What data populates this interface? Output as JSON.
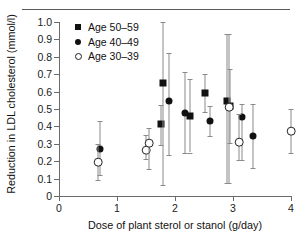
{
  "chart_data": {
    "type": "scatter",
    "title": "",
    "xlabel": "Dose of plant sterol or stanol (g/day)",
    "ylabel": "Reduction in LDL cholesterol (mmol/l)",
    "xlim": [
      0,
      4
    ],
    "ylim": [
      0,
      1.0
    ],
    "xticks": [
      "0",
      "1",
      "2",
      "3",
      "4"
    ],
    "yticks": [
      "0",
      "0.1",
      "0.2",
      "0.3",
      "0.4",
      "0.5",
      "0.6",
      "0.7",
      "0.8",
      "0.9",
      "1.0"
    ],
    "grid": false,
    "legend_position": "top-left",
    "error_bars": "vertical with caps",
    "series": [
      {
        "name": "Age 50–59",
        "marker": "filled-square",
        "color": "#111111",
        "points": [
          {
            "x": 1.75,
            "y": 0.415,
            "lo": 0.295,
            "hi": 0.525
          },
          {
            "x": 1.8,
            "y": 0.648,
            "lo": 0.062,
            "hi": 1.0
          },
          {
            "x": 2.26,
            "y": 0.458,
            "lo": 0.25,
            "hi": 0.672
          },
          {
            "x": 2.52,
            "y": 0.592,
            "lo": 0.482,
            "hi": 0.7
          },
          {
            "x": 2.9,
            "y": 0.545,
            "lo": 0.075,
            "hi": 0.93
          },
          {
            "x": 2.95,
            "y": 0.515,
            "lo": 0.305,
            "hi": 0.728
          }
        ]
      },
      {
        "name": "Age 40–49",
        "marker": "filled-circle",
        "color": "#111111",
        "points": [
          {
            "x": 0.7,
            "y": 0.268,
            "lo": 0.118,
            "hi": 0.432
          },
          {
            "x": 1.9,
            "y": 0.548,
            "lo": 0.235,
            "hi": 0.82
          },
          {
            "x": 2.18,
            "y": 0.478,
            "lo": 0.248,
            "hi": 0.71
          },
          {
            "x": 2.6,
            "y": 0.432,
            "lo": 0.342,
            "hi": 0.52
          },
          {
            "x": 3.15,
            "y": 0.452,
            "lo": 0.208,
            "hi": 0.53
          },
          {
            "x": 3.35,
            "y": 0.345,
            "lo": 0.16,
            "hi": 0.53
          }
        ]
      },
      {
        "name": "Age 30–39",
        "marker": "open-circle",
        "color": "#222222",
        "points": [
          {
            "x": 0.68,
            "y": 0.198,
            "lo": 0.092,
            "hi": 0.3
          },
          {
            "x": 1.5,
            "y": 0.262,
            "lo": 0.212,
            "hi": 0.352
          },
          {
            "x": 1.56,
            "y": 0.302,
            "lo": 0.155,
            "hi": 0.392
          },
          {
            "x": 2.93,
            "y": 0.51,
            "lo": 0.075,
            "hi": 0.93
          },
          {
            "x": 3.1,
            "y": 0.308,
            "lo": 0.205,
            "hi": 0.47
          },
          {
            "x": 4.0,
            "y": 0.375,
            "lo": 0.248,
            "hi": 0.502
          }
        ]
      }
    ]
  },
  "legend": {
    "items": [
      {
        "label": "Age 50–59",
        "marker": "filled-square"
      },
      {
        "label": "Age 40–49",
        "marker": "filled-circle"
      },
      {
        "label": "Age 30–39",
        "marker": "open-circle"
      }
    ]
  }
}
